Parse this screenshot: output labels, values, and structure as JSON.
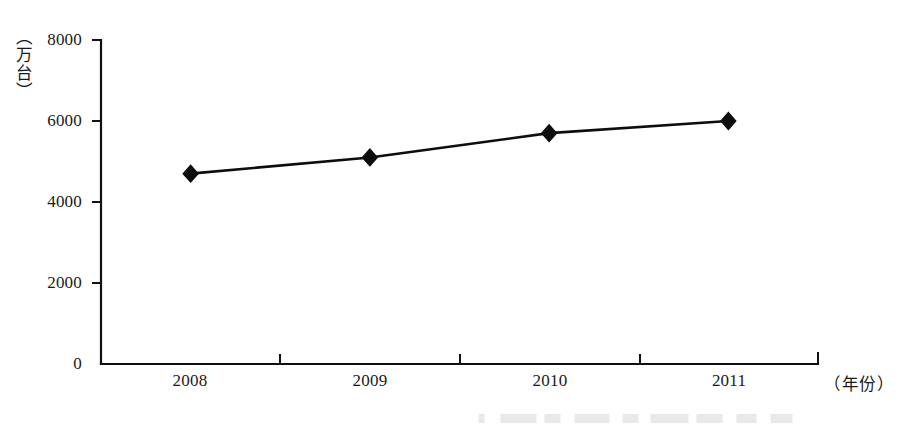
{
  "chart_data": {
    "type": "line",
    "title": "",
    "subtitle": "",
    "xlabel": "（年份）",
    "ylabel": "（万台）",
    "categories": [
      "2008",
      "2009",
      "2010",
      "2011"
    ],
    "values": [
      4700,
      5100,
      5700,
      6000
    ],
    "series": [
      {
        "name": "",
        "values": [
          4700,
          5100,
          5700,
          6000
        ]
      }
    ],
    "ylim": [
      0,
      8000
    ],
    "ytick_labels": [
      "0",
      "2000",
      "4000",
      "6000",
      "8000"
    ],
    "ytick_values": [
      0,
      2000,
      4000,
      6000,
      8000
    ],
    "xtick_labels": [
      "2008",
      "2009",
      "2010",
      "2011"
    ],
    "grid": false,
    "legend": false,
    "legend_position": "none",
    "marker": "diamond",
    "annotations": []
  },
  "colors": {
    "line": "#0d0d0d",
    "marker": "#0d0d0d",
    "axis": "#111111",
    "text": "#1a1a1a",
    "background": "#ffffff"
  }
}
